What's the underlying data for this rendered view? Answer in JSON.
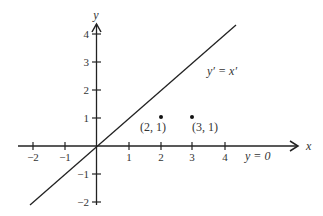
{
  "diagram": {
    "axes": {
      "x_label": "x",
      "y_label": "y",
      "x_ticks": [
        {
          "value": -2,
          "label": "−2"
        },
        {
          "value": -1,
          "label": "−1"
        },
        {
          "value": 1,
          "label": "1"
        },
        {
          "value": 2,
          "label": "2"
        },
        {
          "value": 3,
          "label": "3"
        },
        {
          "value": 4,
          "label": "4"
        }
      ],
      "y_ticks": [
        {
          "value": -2,
          "label": "−2"
        },
        {
          "value": -1,
          "label": "−1"
        },
        {
          "value": 1,
          "label": "1"
        },
        {
          "value": 2,
          "label": "2"
        },
        {
          "value": 3,
          "label": "3"
        },
        {
          "value": 4,
          "label": "4"
        }
      ]
    },
    "lines": [
      {
        "label": "y′ = x′"
      },
      {
        "label": "y = 0"
      }
    ],
    "points": [
      {
        "x": 2,
        "y": 1,
        "label": "(2, 1)"
      },
      {
        "x": 3,
        "y": 1,
        "label": "(3, 1)"
      }
    ],
    "colors": {
      "stroke": "#222222",
      "text": "#333333"
    }
  }
}
